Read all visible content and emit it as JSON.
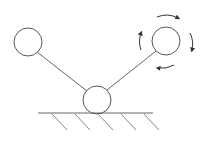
{
  "diagram": {
    "width": 207,
    "height": 141,
    "stroke_color": "#555555",
    "background": "#ffffff",
    "nodes": [
      {
        "id": "left-ball",
        "cx": 28,
        "cy": 42,
        "r": 14
      },
      {
        "id": "right-ball",
        "cx": 166,
        "cy": 41,
        "r": 14
      },
      {
        "id": "pivot-ball",
        "cx": 97,
        "cy": 100,
        "r": 14
      }
    ],
    "links": [
      {
        "from": "left-ball",
        "to": "pivot-ball"
      },
      {
        "from": "right-ball",
        "to": "pivot-ball"
      }
    ],
    "ground": {
      "x1": 38,
      "x2": 153,
      "y": 113,
      "hatch_count": 5
    },
    "rotation_indicator": {
      "target": "right-ball",
      "radius": 25,
      "direction": "clockwise",
      "arrow_count": 4
    }
  }
}
